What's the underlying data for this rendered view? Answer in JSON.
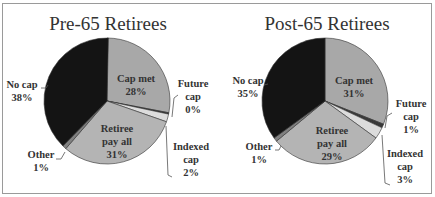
{
  "chart_data": [
    {
      "type": "pie",
      "title": "Pre-65 Retirees",
      "categories": [
        "Cap met",
        "Future cap",
        "Indexed cap",
        "Retiree pay all",
        "Other",
        "No cap"
      ],
      "values": [
        28,
        0,
        2,
        31,
        1,
        38
      ],
      "labels": [
        "28%",
        "0%",
        "2%",
        "31%",
        "1%",
        "38%"
      ],
      "colors": [
        "#a8a8a8",
        "#3a3a3a",
        "#dcdcdc",
        "#b4b4b4",
        "#808080",
        "#141414"
      ]
    },
    {
      "type": "pie",
      "title": "Post-65 Retirees",
      "categories": [
        "Cap met",
        "Future cap",
        "Indexed cap",
        "Retiree pay all",
        "Other",
        "No cap"
      ],
      "values": [
        31,
        1,
        3,
        29,
        1,
        35
      ],
      "labels": [
        "31%",
        "1%",
        "3%",
        "29%",
        "1%",
        "35%"
      ],
      "colors": [
        "#a8a8a8",
        "#3a3a3a",
        "#dcdcdc",
        "#b4b4b4",
        "#808080",
        "#141414"
      ]
    }
  ],
  "charts": [
    {
      "title": "Pre-65 Retirees",
      "cap_met": {
        "name": "Cap met",
        "pct": "28%"
      },
      "future_cap": {
        "name1": "Future",
        "name2": "cap",
        "pct": "0%"
      },
      "indexed_cap": {
        "name1": "Indexed",
        "name2": "cap",
        "pct": "2%"
      },
      "retiree_pay_all": {
        "name1": "Retiree",
        "name2": "pay all",
        "pct": "31%"
      },
      "other": {
        "name": "Other",
        "pct": "1%"
      },
      "no_cap": {
        "name": "No cap",
        "pct": "38%"
      }
    },
    {
      "title": "Post-65 Retirees",
      "cap_met": {
        "name": "Cap met",
        "pct": "31%"
      },
      "future_cap": {
        "name1": "Future",
        "name2": "cap",
        "pct": "1%"
      },
      "indexed_cap": {
        "name1": "Indexed",
        "name2": "cap",
        "pct": "3%"
      },
      "retiree_pay_all": {
        "name1": "Retiree",
        "name2": "pay all",
        "pct": "29%"
      },
      "other": {
        "name": "Other",
        "pct": "1%"
      },
      "no_cap": {
        "name": "No cap",
        "pct": "35%"
      }
    }
  ]
}
